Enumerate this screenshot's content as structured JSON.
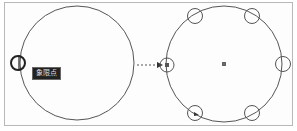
{
  "tooltip": {
    "label": "象限点"
  },
  "colors": {
    "stroke": "#555555",
    "frame": "#b8b8b8",
    "marker": "#444444",
    "tooltip_bg": "#222222"
  },
  "left_figure": {
    "shape": "circle",
    "snap_marker": "quadrant-snap",
    "position": "left-quadrant"
  },
  "right_figure": {
    "shape": "circle",
    "quadrant_markers": 6,
    "center_marker": "square"
  },
  "connector": {
    "style": "dashed-arrow"
  }
}
